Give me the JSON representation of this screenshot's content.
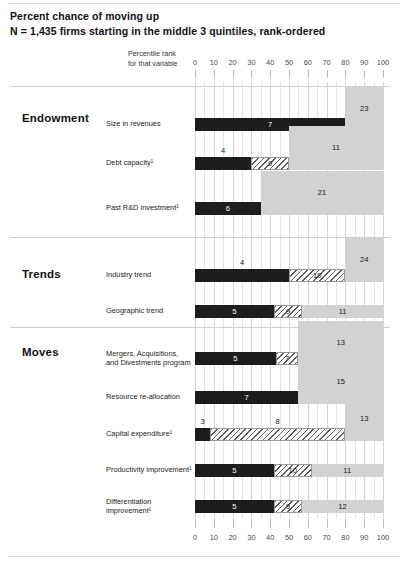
{
  "header": {
    "title": "Percent chance of moving up",
    "subtitle": "N = 1,435 firms starting in the middle 3 quintiles, rank-ordered",
    "axis_caption_line1": "Percentile rank",
    "axis_caption_line2": "for that variable"
  },
  "chart_data": {
    "type": "bar",
    "orientation": "horizontal",
    "stacked": true,
    "title": "Percent chance of moving up",
    "subtitle": "N = 1,435 firms starting in the middle 3 quintiles, rank-ordered",
    "xlabel": "Percentile rank for that variable",
    "ylabel": "",
    "xlim": [
      0,
      100
    ],
    "xticks": [
      0,
      10,
      20,
      30,
      40,
      50,
      60,
      70,
      80,
      90,
      100
    ],
    "xtick_labels": [
      "0",
      "10",
      "20",
      "30",
      "40",
      "50",
      "60",
      "70",
      "80",
      "90",
      "100"
    ],
    "grid": true,
    "legend_position": "none",
    "series": [
      {
        "name": "low-percentile segment",
        "style": "solid-dark",
        "color": "#1d1d1d"
      },
      {
        "name": "mid-percentile segment",
        "style": "hatched",
        "color": "#ffffff"
      },
      {
        "name": "high-percentile segment",
        "style": "solid-light",
        "color": "#d2d2d2"
      }
    ],
    "groups": [
      {
        "name": "Endowment",
        "rows": [
          {
            "label": "Size in revenues",
            "segments": [
              {
                "style": "dark",
                "start": 0,
                "end": 80,
                "value": 7,
                "label_pos": "inside"
              },
              {
                "style": "light",
                "start": 80,
                "end": 100,
                "value": 23,
                "label_pos": "above"
              }
            ]
          },
          {
            "label": "Debt capacity¹",
            "segments": [
              {
                "style": "dark",
                "start": 0,
                "end": 30,
                "value": 4,
                "label_pos": "above"
              },
              {
                "style": "hatch",
                "start": 30,
                "end": 50,
                "value": 9,
                "label_pos": "inside"
              },
              {
                "style": "light",
                "start": 50,
                "end": 100,
                "value": 11,
                "label_pos": "above"
              }
            ]
          },
          {
            "label": "Past R&D investment¹",
            "segments": [
              {
                "style": "dark",
                "start": 0,
                "end": 35,
                "value": 6,
                "label_pos": "inside"
              },
              {
                "style": "light",
                "start": 35,
                "end": 100,
                "value": 21,
                "label_pos": "above"
              }
            ]
          }
        ]
      },
      {
        "name": "Trends",
        "rows": [
          {
            "label": "Industry trend",
            "segments": [
              {
                "style": "dark",
                "start": 0,
                "end": 50,
                "value": 4,
                "label_pos": "above"
              },
              {
                "style": "hatch",
                "start": 50,
                "end": 80,
                "value": 10,
                "label_pos": "inside"
              },
              {
                "style": "light",
                "start": 80,
                "end": 100,
                "value": 24,
                "label_pos": "above"
              }
            ]
          },
          {
            "label": "Geographic trend",
            "segments": [
              {
                "style": "dark",
                "start": 0,
                "end": 42,
                "value": 5,
                "label_pos": "inside"
              },
              {
                "style": "hatch",
                "start": 42,
                "end": 57,
                "value": 9,
                "label_pos": "inside"
              },
              {
                "style": "light",
                "start": 57,
                "end": 100,
                "value": 11,
                "label_pos": "inside"
              }
            ]
          }
        ]
      },
      {
        "name": "Moves",
        "rows": [
          {
            "label": "Mergers, Acquisitions, and Divestments program",
            "segments": [
              {
                "style": "dark",
                "start": 0,
                "end": 43,
                "value": 5,
                "label_pos": "inside"
              },
              {
                "style": "hatch",
                "start": 43,
                "end": 55,
                "value": 7,
                "label_pos": "inside"
              },
              {
                "style": "light",
                "start": 55,
                "end": 100,
                "value": 13,
                "label_pos": "above"
              }
            ]
          },
          {
            "label": "Resource re-allocation",
            "segments": [
              {
                "style": "dark",
                "start": 0,
                "end": 55,
                "value": 7,
                "label_pos": "inside"
              },
              {
                "style": "light",
                "start": 55,
                "end": 100,
                "value": 15,
                "label_pos": "above"
              }
            ]
          },
          {
            "label": "Capital expenditure¹",
            "segments": [
              {
                "style": "dark",
                "start": 0,
                "end": 8,
                "value": 3,
                "label_pos": "above"
              },
              {
                "style": "hatch",
                "start": 8,
                "end": 80,
                "value": 8,
                "label_pos": "above"
              },
              {
                "style": "light",
                "start": 80,
                "end": 100,
                "value": 13,
                "label_pos": "above"
              }
            ]
          },
          {
            "label": "Productivity improvement¹",
            "segments": [
              {
                "style": "dark",
                "start": 0,
                "end": 42,
                "value": 5,
                "label_pos": "inside"
              },
              {
                "style": "hatch",
                "start": 42,
                "end": 62,
                "value": 10,
                "label_pos": "inside"
              },
              {
                "style": "light",
                "start": 62,
                "end": 100,
                "value": 11,
                "label_pos": "inside"
              }
            ]
          },
          {
            "label": "Differentiation improvement¹",
            "segments": [
              {
                "style": "dark",
                "start": 0,
                "end": 42,
                "value": 5,
                "label_pos": "inside"
              },
              {
                "style": "hatch",
                "start": 42,
                "end": 57,
                "value": 9,
                "label_pos": "inside"
              },
              {
                "style": "light",
                "start": 57,
                "end": 100,
                "value": 12,
                "label_pos": "inside"
              }
            ]
          }
        ]
      }
    ]
  },
  "colors": {
    "dark": "#1d1d1d",
    "light": "#d2d2d2",
    "hatch_line": "#5b5b5b",
    "gridline": "#e3e3e3",
    "separator": "#cfcfcf"
  }
}
